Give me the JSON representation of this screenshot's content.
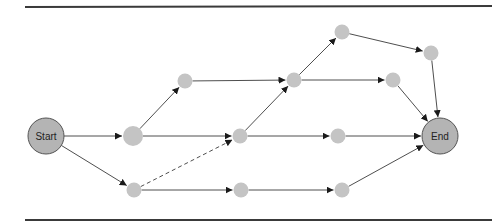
{
  "diagram": {
    "type": "network-flow",
    "colors": {
      "rule": "#3a3a3a",
      "edge": "#3a3a3a",
      "terminal_fill": "#b4b4b4",
      "terminal_stroke": "#555555",
      "node_fill": "#c4c4c4",
      "label": "#222222"
    },
    "rules": [
      {
        "x1": 25,
        "y1": 7,
        "x2": 492,
        "y2": 6
      },
      {
        "x1": 25,
        "y1": 220,
        "x2": 492,
        "y2": 220
      }
    ],
    "nodes": [
      {
        "id": "start",
        "label": "Start",
        "x": 46,
        "y": 136,
        "r": 18,
        "terminal": true
      },
      {
        "id": "n1",
        "label": "",
        "x": 133,
        "y": 136,
        "r": 10,
        "terminal": false
      },
      {
        "id": "n2",
        "label": "",
        "x": 185,
        "y": 81,
        "r": 7.5,
        "terminal": false
      },
      {
        "id": "n3",
        "label": "",
        "x": 240,
        "y": 136,
        "r": 7.5,
        "terminal": false
      },
      {
        "id": "n4",
        "label": "",
        "x": 294,
        "y": 80,
        "r": 7.5,
        "terminal": false
      },
      {
        "id": "n5",
        "label": "",
        "x": 342,
        "y": 32,
        "r": 7.5,
        "terminal": false
      },
      {
        "id": "n6",
        "label": "",
        "x": 431,
        "y": 53,
        "r": 7.5,
        "terminal": false
      },
      {
        "id": "n7",
        "label": "",
        "x": 393,
        "y": 80,
        "r": 7.5,
        "terminal": false
      },
      {
        "id": "n8",
        "label": "",
        "x": 338,
        "y": 136,
        "r": 7.5,
        "terminal": false
      },
      {
        "id": "n9",
        "label": "",
        "x": 134,
        "y": 190,
        "r": 7.5,
        "terminal": false
      },
      {
        "id": "n10",
        "label": "",
        "x": 241,
        "y": 190,
        "r": 7.5,
        "terminal": false
      },
      {
        "id": "n11",
        "label": "",
        "x": 342,
        "y": 190,
        "r": 7.5,
        "terminal": false
      },
      {
        "id": "end",
        "label": "End",
        "x": 440,
        "y": 136,
        "r": 18,
        "terminal": true
      }
    ],
    "edges": [
      {
        "from": "start",
        "to": "n1",
        "dashed": false
      },
      {
        "from": "start",
        "to": "n9",
        "dashed": false
      },
      {
        "from": "n1",
        "to": "n2",
        "dashed": false
      },
      {
        "from": "n1",
        "to": "n3",
        "dashed": false
      },
      {
        "from": "n2",
        "to": "n4",
        "dashed": false
      },
      {
        "from": "n9",
        "to": "n3",
        "dashed": true
      },
      {
        "from": "n9",
        "to": "n10",
        "dashed": false
      },
      {
        "from": "n3",
        "to": "n4",
        "dashed": false
      },
      {
        "from": "n3",
        "to": "n8",
        "dashed": false
      },
      {
        "from": "n4",
        "to": "n5",
        "dashed": false
      },
      {
        "from": "n4",
        "to": "n7",
        "dashed": false
      },
      {
        "from": "n5",
        "to": "n6",
        "dashed": false
      },
      {
        "from": "n6",
        "to": "end",
        "dashed": false
      },
      {
        "from": "n7",
        "to": "end",
        "dashed": false
      },
      {
        "from": "n8",
        "to": "end",
        "dashed": false
      },
      {
        "from": "n10",
        "to": "n11",
        "dashed": false
      },
      {
        "from": "n11",
        "to": "end",
        "dashed": false
      }
    ]
  }
}
